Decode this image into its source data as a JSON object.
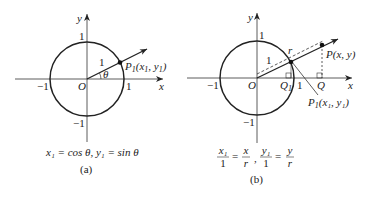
{
  "figure_a": {
    "axis_x": "x",
    "axis_y": "y",
    "origin": "O",
    "tick_pos_x": "1",
    "tick_neg_x": "−1",
    "tick_pos_y": "1",
    "tick_neg_y": "−1",
    "radius_label": "1",
    "angle_label": "θ",
    "point_label": "P",
    "point_sub": "1",
    "point_coords_open": "(x",
    "point_coords_mid": ", y",
    "point_coords_close": ")",
    "caption_equation": "x₁ = cos θ, y₁ = sin θ",
    "caption": "(a)"
  },
  "figure_b": {
    "axis_x": "x",
    "axis_y": "y",
    "origin": "O",
    "tick_pos_x": "1",
    "tick_neg_x": "−1",
    "tick_pos_y": "1",
    "tick_neg_y": "−1",
    "radius_label": "1",
    "r_label": "r",
    "point_p_label": "P(x, y)",
    "point_p1_label": "P",
    "point_p1_sub": "1",
    "point_p1_coords": "(x₁, y₁)",
    "q_label": "Q",
    "q1_label": "Q",
    "q1_sub": "1",
    "eq_num1": "x₁",
    "eq_den1": "1",
    "eq_num2": "x",
    "eq_den2": "r",
    "eq_num3": "y₁",
    "eq_den3": "1",
    "eq_num4": "y",
    "eq_den4": "r",
    "eq_sep": ",",
    "eq_equals": "=",
    "caption": "(b)"
  }
}
